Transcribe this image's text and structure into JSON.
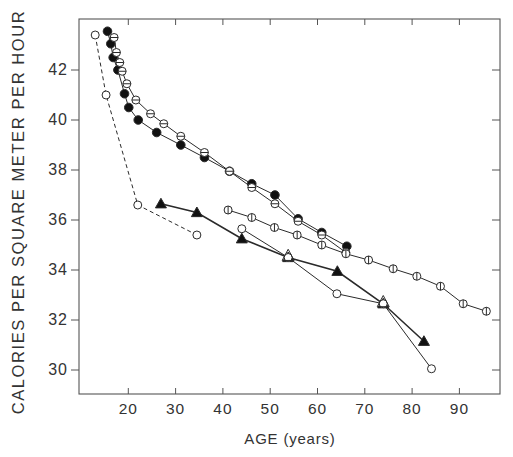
{
  "chart_data": {
    "type": "line",
    "title": "",
    "xlabel": "AGE (years)",
    "ylabel": "CALORIES PER SQUARE METER PER HOUR",
    "xlim": [
      9.6,
      99.4
    ],
    "ylim": [
      29.0,
      44.0
    ],
    "xticks": [
      20,
      30,
      40,
      50,
      60,
      70,
      80,
      90
    ],
    "yticks": [
      30,
      32,
      34,
      36,
      38,
      40,
      42
    ],
    "grid": false,
    "legend": null,
    "series": [
      {
        "name": "open circles (dashed)",
        "marker": "open-circle",
        "line": "dashed",
        "x": [
          13.0,
          15.3,
          22.0,
          34.5
        ],
        "y": [
          43.4,
          41.0,
          36.6,
          35.4
        ]
      },
      {
        "name": "filled circles",
        "marker": "filled-circle",
        "line": "solid",
        "x": [
          15.6,
          16.3,
          16.8,
          17.8,
          19.2,
          20.1,
          22.1,
          26.0,
          31.1,
          36.1,
          41.4,
          46.1,
          51.0,
          55.9,
          60.9,
          66.2
        ],
        "y": [
          43.55,
          43.05,
          42.5,
          42.0,
          41.05,
          40.5,
          40.0,
          39.5,
          39.0,
          38.5,
          37.95,
          37.45,
          37.0,
          36.05,
          35.5,
          34.95
        ]
      },
      {
        "name": "horizontally barred circles",
        "marker": "hbar-circle",
        "line": "solid",
        "x": [
          17.0,
          17.5,
          18.2,
          18.7,
          19.7,
          21.6,
          24.7,
          27.5,
          31.1,
          36.1,
          41.4,
          46.1,
          51.0,
          55.9,
          60.9,
          66.0
        ],
        "y": [
          43.3,
          42.7,
          42.3,
          41.95,
          41.45,
          40.8,
          40.25,
          39.85,
          39.35,
          38.7,
          37.95,
          37.3,
          36.65,
          35.95,
          35.4,
          34.7
        ]
      },
      {
        "name": "vertically barred circles",
        "marker": "vbar-circle",
        "line": "solid",
        "x": [
          41.1,
          46.1,
          50.9,
          55.7,
          60.9,
          66.0,
          70.8,
          76.0,
          81.0,
          86.0,
          90.8,
          95.7
        ],
        "y": [
          36.4,
          36.1,
          35.7,
          35.4,
          35.0,
          34.65,
          34.4,
          34.05,
          33.75,
          33.35,
          32.65,
          32.35
        ]
      },
      {
        "name": "filled triangles",
        "marker": "filled-triangle",
        "line": "solid",
        "x": [
          26.9,
          34.5,
          44.0,
          53.8,
          64.2,
          73.9,
          82.5
        ],
        "y": [
          36.65,
          36.3,
          35.25,
          34.5,
          33.95,
          32.65,
          31.15
        ]
      },
      {
        "name": "open circles (solid)",
        "marker": "open-circle",
        "line": "solid",
        "x": [
          44.0,
          53.8,
          64.1,
          73.9,
          84.1
        ],
        "y": [
          35.65,
          34.5,
          33.05,
          32.65,
          30.05
        ]
      },
      {
        "name": "open triangles",
        "marker": "open-triangle",
        "line": "none",
        "x": [
          53.8,
          73.9
        ],
        "y": [
          34.55,
          32.7
        ]
      }
    ]
  },
  "axes": {
    "xlabel": "AGE (years)",
    "ylabel": "CALORIES PER SQUARE METER PER HOUR",
    "xtick_labels": [
      "20",
      "30",
      "40",
      "50",
      "60",
      "70",
      "80",
      "90"
    ],
    "ytick_labels": [
      "30",
      "32",
      "34",
      "36",
      "38",
      "40",
      "42"
    ]
  },
  "colors": {
    "ink": "#2a2a2a",
    "background": "#ffffff"
  }
}
